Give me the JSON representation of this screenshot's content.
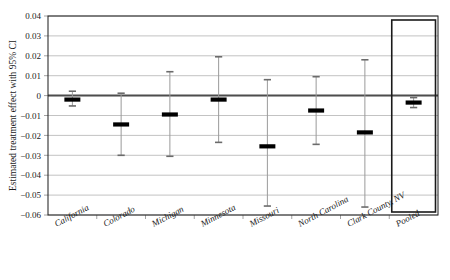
{
  "chart_data": {
    "type": "scatter",
    "subtype": "forest-plot",
    "title": "",
    "xlabel": "",
    "ylabel": "Estimated treatment effect with 95% CI",
    "ylim": [
      -0.06,
      0.04
    ],
    "ytick_labels": [
      "0.04",
      "0.03",
      "0.02",
      "0.01",
      "0",
      "-0.01",
      "-0.02",
      "-0.03",
      "-0.04",
      "-0.05",
      "-0.06"
    ],
    "ytick_values": [
      0.04,
      0.03,
      0.02,
      0.01,
      0,
      -0.01,
      -0.02,
      -0.03,
      -0.04,
      -0.05,
      -0.06
    ],
    "grid": true,
    "grid_orientation": "horizontal",
    "legend": "none",
    "reference_line": 0,
    "categories": [
      "California",
      "Colorado",
      "Michigan",
      "Minnesota",
      "Missouri",
      "North Carolina",
      "Clark County, NV",
      "Pooled"
    ],
    "series": [
      {
        "name": "Estimated treatment effect",
        "estimates": [
          -0.002,
          -0.0145,
          -0.0095,
          -0.002,
          -0.0255,
          -0.0075,
          -0.0185,
          -0.0035
        ],
        "ci_lower": [
          -0.0052,
          -0.03,
          -0.0305,
          -0.0235,
          -0.0555,
          -0.0245,
          -0.056,
          -0.006
        ],
        "ci_upper": [
          0.0022,
          0.0012,
          0.012,
          0.0195,
          0.008,
          0.0095,
          0.018,
          -0.001
        ]
      }
    ],
    "highlighted_category": "Pooled",
    "colors": {
      "marker": "#000000",
      "ci_line": "#9a9a9a",
      "ci_cap": "#6b6b6b",
      "gridline": "#a9a9a9",
      "zero_line": "#4d4d4d",
      "frame": "#1a1a1a",
      "highlight_box": "#1a1a1a",
      "background": "#ffffff"
    }
  }
}
